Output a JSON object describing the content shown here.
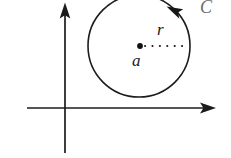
{
  "figure": {
    "kind": "complex-plane-contour-diagram",
    "width": 231,
    "height": 158,
    "background_color": "#ffffff"
  },
  "axes": {
    "stroke_color": "#1c1c1c",
    "horizontal": {
      "name": "real-axis",
      "y": 108,
      "x_start": 27,
      "x_end": 216,
      "arrow_at": "right"
    },
    "vertical": {
      "name": "imaginary-axis",
      "x": 65,
      "y_start": 153,
      "y_end": 3,
      "arrow_at": "top"
    }
  },
  "contour": {
    "label": "C",
    "center_x": 139,
    "center_y": 46,
    "radius": 51,
    "orientation": "counterclockwise",
    "stroke_color": "#1c1c1c"
  },
  "center_point": {
    "label": "a",
    "x": 140,
    "y": 46,
    "dot_color": "#111111"
  },
  "radius_segment": {
    "label": "r",
    "style": "dotted",
    "from_x": 140,
    "from_y": 46,
    "to_x": 190,
    "to_y": 46
  },
  "labels": {
    "radius_label": "r",
    "center_label": "a",
    "contour_label": "C"
  }
}
